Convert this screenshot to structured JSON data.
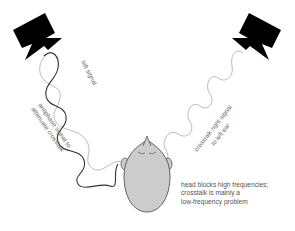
{
  "diagram": {
    "type": "crosstalk-cancellation illustration",
    "colors": {
      "speaker": "#000000",
      "left_signal_wave": "#333333",
      "antiphase_wave": "#aaaaaa",
      "crosstalk_wave": "#aaaaaa",
      "head_fill": "#cccccc",
      "head_outline": "#444444",
      "label_text": "#666666"
    },
    "speakers": [
      {
        "id": "left",
        "name": "left loudspeaker"
      },
      {
        "id": "right",
        "name": "right loudspeaker"
      }
    ],
    "labels": {
      "left_signal": "left signal",
      "antiphase_line1": "antiphase signal to",
      "antiphase_line2": "attenuate crosstalk",
      "crosstalk_line1": "crosstalk right signal",
      "crosstalk_line2": "to left ear"
    },
    "note": {
      "line1": "head blocks high frequencies;",
      "line2": "crosstalk is mainly a",
      "line3": "low-frequency problem"
    },
    "head": {
      "name": "listener head (top view)"
    }
  }
}
